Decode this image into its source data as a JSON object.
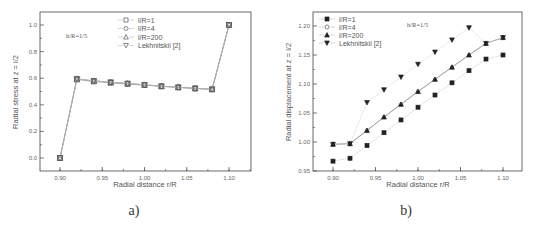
{
  "chart_data": [
    {
      "type": "line",
      "panel_label": "a)",
      "title": "",
      "xlabel": "Radial distance r/R",
      "ylabel": "Radial stress at z = l/2",
      "annotation": "h/R=1/5",
      "xlim": [
        0.875,
        1.125
      ],
      "ylim": [
        -0.1,
        1.1
      ],
      "xticks": [
        "0.90",
        "0.95",
        "1.00",
        "1.05",
        "1.10"
      ],
      "yticks": [
        "0.0",
        "0.2",
        "0.4",
        "0.6",
        "0.8",
        "1.0"
      ],
      "grid": false,
      "legend_position": "upper center",
      "x": [
        0.9,
        0.92,
        0.94,
        0.96,
        0.98,
        1.0,
        1.02,
        1.04,
        1.06,
        1.08,
        1.1
      ],
      "series": [
        {
          "name": "l/R=1",
          "marker": "open-square",
          "values": [
            0.0,
            0.59,
            0.575,
            0.565,
            0.555,
            0.547,
            0.538,
            0.53,
            0.522,
            0.515,
            1.0
          ]
        },
        {
          "name": "l/R=4",
          "marker": "open-circle",
          "values": [
            0.0,
            0.595,
            0.58,
            0.57,
            0.56,
            0.55,
            0.54,
            0.532,
            0.524,
            0.517,
            1.0
          ]
        },
        {
          "name": "l/R=200",
          "marker": "open-triangle-up",
          "values": [
            0.0,
            0.595,
            0.58,
            0.57,
            0.56,
            0.55,
            0.54,
            0.532,
            0.524,
            0.517,
            1.0
          ]
        },
        {
          "name": "Lekhnitskii [2]",
          "marker": "open-triangle-down",
          "values": [
            0.0,
            0.595,
            0.58,
            0.57,
            0.56,
            0.55,
            0.54,
            0.532,
            0.524,
            0.517,
            1.0
          ]
        }
      ]
    },
    {
      "type": "line",
      "panel_label": "b)",
      "title": "",
      "xlabel": "Radial distance r/R",
      "ylabel": "Radial displacement at z = l/2",
      "annotation": "h/R=1/5",
      "xlim": [
        0.875,
        1.125
      ],
      "ylim": [
        0.95,
        1.21
      ],
      "xticks": [
        "0.90",
        "0.95",
        "1.00",
        "1.05",
        "1.10"
      ],
      "yticks": [
        "0.95",
        "1.00",
        "1.05",
        "1.10",
        "1.15",
        "1.20"
      ],
      "grid": false,
      "legend_position": "upper left",
      "x": [
        0.9,
        0.92,
        0.94,
        0.96,
        0.98,
        1.0,
        1.02,
        1.04,
        1.06,
        1.08,
        1.1
      ],
      "series": [
        {
          "name": "l/R=1",
          "marker": "filled-square",
          "values": [
            0.967,
            0.972,
            0.994,
            1.016,
            1.038,
            1.06,
            1.081,
            1.102,
            1.123,
            1.143,
            1.15
          ]
        },
        {
          "name": "l/R=4",
          "marker": "open-circle",
          "values": [
            0.996,
            0.997,
            1.02,
            1.043,
            1.065,
            1.087,
            1.108,
            1.129,
            1.15,
            1.17,
            1.18
          ]
        },
        {
          "name": "l/R=200",
          "marker": "filled-triangle-up",
          "values": [
            0.996,
            0.997,
            1.02,
            1.043,
            1.065,
            1.087,
            1.108,
            1.129,
            1.15,
            1.17,
            1.18
          ]
        },
        {
          "name": "Lekhnitskii [2]",
          "marker": "filled-triangle-down",
          "values": [
            0.996,
            0.997,
            1.068,
            1.09,
            1.112,
            1.134,
            1.155,
            1.176,
            1.197,
            1.17,
            1.18
          ]
        }
      ]
    }
  ],
  "panels": {
    "a": {
      "caption": "a)",
      "xlabel": "Radial distance r/R",
      "ylabel": "Radial stress at z = l/2",
      "annotation": "h/R=1/5",
      "legend": [
        "l/R=1",
        "l/R=4",
        "l/R=200",
        "Lekhnitskii [2]"
      ]
    },
    "b": {
      "caption": "b)",
      "xlabel": "Radial distance r/R",
      "ylabel": "Radial displacement at z = l/2",
      "annotation": "h/R=1/5",
      "legend": [
        "l/R=1",
        "l/R=4",
        "l/R=200",
        "Lekhnitskii [2]"
      ]
    }
  }
}
